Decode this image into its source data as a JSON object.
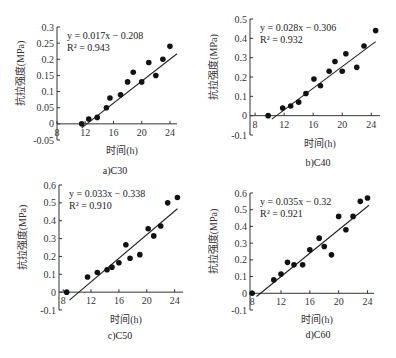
{
  "chart_data": [
    {
      "type": "scatter",
      "caption": "a)C30",
      "title": "",
      "xlabel": "时间(h)",
      "ylabel": "抗拉强度(MPa)",
      "equation": "y = 0.017x − 0.208",
      "r2": "R² = 0.943",
      "xlim": [
        8,
        25
      ],
      "ylim": [
        -0.05,
        0.3
      ],
      "xticks": [
        8,
        12,
        16,
        20,
        24
      ],
      "yticks": [
        -0.05,
        0,
        0.05,
        0.1,
        0.15,
        0.2,
        0.25,
        0.3
      ],
      "fit": {
        "slope": 0.017,
        "intercept": -0.208,
        "x_start": 11.5,
        "x_end": 25
      },
      "points": [
        [
          11.5,
          0
        ],
        [
          12.5,
          0.015
        ],
        [
          13.7,
          0.02
        ],
        [
          15,
          0.05
        ],
        [
          15.5,
          0.08
        ],
        [
          17,
          0.09
        ],
        [
          18,
          0.13
        ],
        [
          18.8,
          0.16
        ],
        [
          20,
          0.13
        ],
        [
          21,
          0.19
        ],
        [
          22,
          0.15
        ],
        [
          23,
          0.2
        ],
        [
          24,
          0.24
        ]
      ],
      "grid": false
    },
    {
      "type": "scatter",
      "caption": "b)C40",
      "title": "",
      "xlabel": "时间(h)",
      "ylabel": "抗拉强度(MPa)",
      "equation": "y = 0.028x − 0.306",
      "r2": "R² = 0.932",
      "xlim": [
        7.5,
        25
      ],
      "ylim": [
        -0.1,
        0.5
      ],
      "xticks": [
        8,
        12,
        16,
        20,
        24
      ],
      "yticks": [
        -0.1,
        0,
        0.1,
        0.2,
        0.3,
        0.4,
        0.5
      ],
      "fit": {
        "slope": 0.028,
        "intercept": -0.306,
        "x_start": 10.3,
        "x_end": 24.6
      },
      "points": [
        [
          9.8,
          0
        ],
        [
          11.8,
          0.04
        ],
        [
          12.9,
          0.05
        ],
        [
          14,
          0.07
        ],
        [
          15,
          0.115
        ],
        [
          16.1,
          0.19
        ],
        [
          17,
          0.155
        ],
        [
          18.2,
          0.23
        ],
        [
          19,
          0.28
        ],
        [
          20,
          0.23
        ],
        [
          20.5,
          0.32
        ],
        [
          22,
          0.25
        ],
        [
          23,
          0.36
        ],
        [
          24.6,
          0.44
        ]
      ],
      "grid": false
    },
    {
      "type": "scatter",
      "caption": "c)C50",
      "title": "",
      "xlabel": "时间(h)",
      "ylabel": "抗拉强度(MPa)",
      "equation": "y = 0.033x − 0.338",
      "r2": "R² = 0.910",
      "xlim": [
        7.5,
        25
      ],
      "ylim": [
        -0.1,
        0.6
      ],
      "xticks": [
        8,
        12,
        16,
        20,
        24
      ],
      "yticks": [
        -0.1,
        0,
        0.1,
        0.2,
        0.3,
        0.4,
        0.5,
        0.6
      ],
      "fit": {
        "slope": 0.033,
        "intercept": -0.338,
        "x_start": 8.9,
        "x_end": 24.4
      },
      "points": [
        [
          8.5,
          0
        ],
        [
          11.5,
          0.085
        ],
        [
          12.9,
          0.11
        ],
        [
          14.3,
          0.125
        ],
        [
          15,
          0.14
        ],
        [
          16,
          0.165
        ],
        [
          17,
          0.265
        ],
        [
          17.6,
          0.19
        ],
        [
          19,
          0.21
        ],
        [
          20.2,
          0.355
        ],
        [
          21,
          0.315
        ],
        [
          22,
          0.37
        ],
        [
          23,
          0.5
        ],
        [
          24.4,
          0.53
        ]
      ],
      "grid": false
    },
    {
      "type": "scatter",
      "caption": "d)C60",
      "title": "",
      "xlabel": "时间(h)",
      "ylabel": "抗拉强度(MPa)",
      "equation": "y = 0.035x − 0.32",
      "r2": "R² = 0.921",
      "xlim": [
        7.5,
        25
      ],
      "ylim": [
        -0.1,
        0.6
      ],
      "xticks": [
        8,
        12,
        16,
        20,
        24
      ],
      "yticks": [
        -0.1,
        0,
        0.1,
        0.2,
        0.3,
        0.4,
        0.5,
        0.6
      ],
      "fit": {
        "slope": 0.035,
        "intercept": -0.32,
        "x_start": 8.6,
        "x_end": 24.2
      },
      "points": [
        [
          8,
          0
        ],
        [
          11,
          0.08
        ],
        [
          12,
          0.115
        ],
        [
          12.9,
          0.185
        ],
        [
          13.8,
          0.17
        ],
        [
          15,
          0.17
        ],
        [
          16,
          0.26
        ],
        [
          17.3,
          0.33
        ],
        [
          18,
          0.28
        ],
        [
          19,
          0.23
        ],
        [
          20,
          0.46
        ],
        [
          21,
          0.38
        ],
        [
          22,
          0.46
        ],
        [
          23,
          0.55
        ],
        [
          24,
          0.57
        ]
      ],
      "grid": false
    }
  ],
  "layout": {
    "panels": [
      {
        "left": 57,
        "top": 27,
        "width": 120,
        "height": 113,
        "x0": 8,
        "x1": 25,
        "y0": -0.05,
        "y1": 0.3,
        "xtick_px": [
          60,
          87,
          114,
          141,
          168
        ],
        "cap_x": 115,
        "cap_y": 174,
        "xlab_y": 154
      },
      {
        "left": 250,
        "top": 19,
        "width": 130,
        "height": 116,
        "x0": 7.3,
        "x1": 25.2,
        "y0": -0.1,
        "y1": 0.5,
        "cap_x": 318,
        "cap_y": 166,
        "xlab_y": 147
      },
      {
        "left": 59,
        "top": 185,
        "width": 124,
        "height": 125,
        "x0": 7.4,
        "x1": 25.2,
        "y0": -0.1,
        "y1": 0.6,
        "cap_x": 120,
        "cap_y": 339,
        "xlab_y": 323
      },
      {
        "left": 250,
        "top": 193,
        "width": 124,
        "height": 117,
        "x0": 7.7,
        "x1": 24.9,
        "y0": -0.1,
        "y1": 0.6,
        "cap_x": 318,
        "cap_y": 338,
        "xlab_y": 323
      }
    ]
  }
}
